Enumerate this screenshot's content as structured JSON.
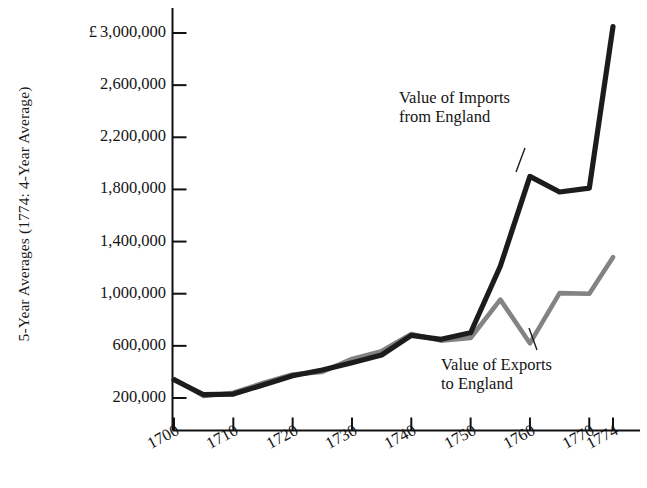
{
  "chart_data": {
    "type": "line",
    "title": "",
    "xlabel": "",
    "ylabel": "5-Year Averages (1774: 4-Year Average)",
    "currency_symbol": "£",
    "x": [
      1700,
      1705,
      1710,
      1715,
      1720,
      1725,
      1730,
      1735,
      1740,
      1745,
      1750,
      1755,
      1760,
      1765,
      1770,
      1774
    ],
    "xlim": [
      1700,
      1774
    ],
    "ylim": [
      0,
      3200000
    ],
    "grid": false,
    "legend_position": "inline-annotations",
    "xtick_labels": [
      "1700",
      "1710",
      "1720",
      "1730",
      "1740",
      "1750",
      "1760",
      "1770",
      "1774"
    ],
    "xtick_values": [
      1700,
      1710,
      1720,
      1730,
      1740,
      1750,
      1760,
      1770,
      1774
    ],
    "ytick_labels": [
      "3,000,000",
      "2,600,000",
      "2,200,000",
      "1,800,000",
      "1,400,000",
      "1,000,000",
      "600,000",
      "200,000"
    ],
    "ytick_values": [
      3000000,
      2600000,
      2200000,
      1800000,
      1400000,
      1000000,
      600000,
      200000
    ],
    "series": [
      {
        "name": "Value of Imports from England",
        "annotation_line1": "Value of Imports",
        "annotation_line2": "from England",
        "color": "#1c1c1c",
        "values": [
          340000,
          225000,
          230000,
          300000,
          370000,
          415000,
          470000,
          530000,
          680000,
          650000,
          700000,
          1210000,
          1900000,
          1780000,
          1810000,
          3050000
        ]
      },
      {
        "name": "Value of Exports to England",
        "annotation_line1": "Value of Exports",
        "annotation_line2": "to England",
        "color": "#838383",
        "values": [
          345000,
          215000,
          240000,
          315000,
          380000,
          400000,
          500000,
          560000,
          690000,
          640000,
          660000,
          955000,
          620000,
          1005000,
          1000000,
          1280000
        ]
      }
    ]
  },
  "caption": {
    "clipped_text": ""
  }
}
